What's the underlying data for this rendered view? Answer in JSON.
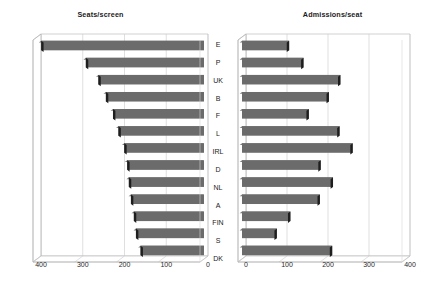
{
  "chart_data": [
    {
      "type": "bar",
      "orientation": "horizontal",
      "title": "Seats/screen",
      "xlabel": "",
      "ylabel": "",
      "categories": [
        "E",
        "P",
        "UK",
        "B",
        "F",
        "L",
        "IRL",
        "D",
        "NL",
        "A",
        "FIN",
        "S",
        "DK"
      ],
      "values": [
        390,
        283,
        253,
        235,
        218,
        205,
        191,
        184,
        180,
        175,
        168,
        163,
        152
      ],
      "xlim": [
        400,
        0
      ],
      "reversed_axis": true,
      "xticks": [
        400,
        300,
        200,
        100,
        0
      ],
      "xtick_labels": [
        "400",
        "300",
        "200",
        "100",
        "0"
      ],
      "grid": true,
      "legend": false,
      "style_3d": true,
      "bar_color": "#6b6b6b",
      "bar_cap_color": "#1e1e1e"
    },
    {
      "type": "bar",
      "orientation": "horizontal",
      "title": "Admissions/seat",
      "xlabel": "",
      "ylabel": "",
      "categories": [
        "E",
        "P",
        "UK",
        "B",
        "F",
        "L",
        "IRL",
        "D",
        "NL",
        "A",
        "FIN",
        "S",
        "DK"
      ],
      "values": [
        115,
        150,
        240,
        212,
        163,
        238,
        270,
        192,
        222,
        190,
        118,
        85,
        220
      ],
      "xlim": [
        0,
        400
      ],
      "reversed_axis": false,
      "xticks": [
        0,
        100,
        200,
        300,
        400
      ],
      "xtick_labels": [
        "0",
        "100",
        "200",
        "300",
        "400"
      ],
      "grid": true,
      "legend": false,
      "style_3d": true,
      "bar_color": "#6b6b6b",
      "bar_cap_color": "#1e1e1e"
    }
  ],
  "figure": {
    "background": "#ffffff",
    "left_panel": {
      "title": "Seats/screen",
      "tick_labels": [
        "400",
        "300",
        "200",
        "100",
        "0"
      ]
    },
    "right_panel": {
      "title": "Admissions/seat",
      "tick_labels": [
        "0",
        "100",
        "200",
        "300",
        "400"
      ]
    },
    "category_labels": [
      "E",
      "P",
      "UK",
      "B",
      "F",
      "L",
      "IRL",
      "D",
      "NL",
      "A",
      "FIN",
      "S",
      "DK"
    ]
  }
}
